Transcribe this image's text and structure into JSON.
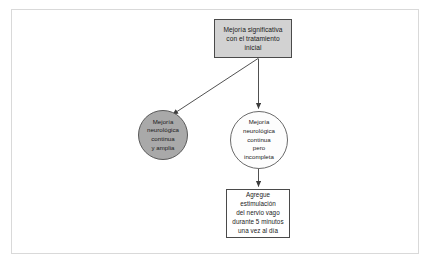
{
  "diagram": {
    "colors": {
      "frame_border": "#d9d9d9",
      "box_fill_gray": "#d2d2d2",
      "circle_fill_gray": "#a9a9a9",
      "circle_fill_white": "#fdfdfd",
      "box_fill_white": "#ffffff",
      "stroke": "#4a4a4a",
      "text": "#1a1a1a"
    },
    "nodes": [
      {
        "id": "initial-improvement",
        "shape": "rectangle",
        "fill": "#d2d2d2",
        "lines": [
          "Mejoría significativa",
          "con el tratamiento",
          "inicial"
        ]
      },
      {
        "id": "full-recovery",
        "shape": "circle",
        "fill": "#a9a9a9",
        "lines": [
          "Mejoría",
          "neurológica",
          "continua",
          "y amplia"
        ]
      },
      {
        "id": "partial-recovery",
        "shape": "circle",
        "fill": "#fdfdfd",
        "lines": [
          "Mejoría",
          "neurológica",
          "continua",
          "pero",
          "incompleta"
        ]
      },
      {
        "id": "vagus-stimulation",
        "shape": "rectangle",
        "fill": "#ffffff",
        "lines": [
          "Agregue",
          "estimulación",
          "del nervio vago",
          "durante 5 minutos",
          "una vez al día"
        ]
      }
    ],
    "connectors": [
      {
        "id": "initial-to-full",
        "from": "initial-improvement",
        "to": "full-recovery",
        "style": "solid-arrow"
      },
      {
        "id": "initial-to-partial",
        "from": "initial-improvement",
        "to": "partial-recovery",
        "style": "solid-arrow"
      },
      {
        "id": "partial-to-vagus",
        "from": "partial-recovery",
        "to": "vagus-stimulation",
        "style": "solid-arrow"
      }
    ]
  }
}
